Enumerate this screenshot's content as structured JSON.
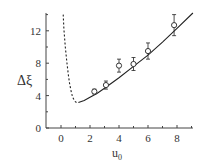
{
  "chart_data": {
    "type": "scatter",
    "title": "",
    "xlabel": "u",
    "xlabel_subscript": "0",
    "ylabel": "Δξ",
    "xlim": [
      -1,
      9.1
    ],
    "ylim": [
      0,
      14.2
    ],
    "xticks": [
      0,
      2,
      4,
      6,
      8
    ],
    "yticks": [
      0,
      4,
      8,
      12
    ],
    "xtick_labels": [
      "0",
      "2",
      "4",
      "6",
      "8"
    ],
    "ytick_labels": [
      "0",
      "4",
      "8",
      "12"
    ],
    "grid": false,
    "legend": null,
    "series": [
      {
        "name": "measured",
        "kind": "points-with-errorbars",
        "marker": "open-circle",
        "x": [
          2.3,
          3.1,
          4.0,
          5.0,
          6.0,
          7.8
        ],
        "y": [
          4.5,
          5.3,
          7.7,
          7.9,
          9.5,
          12.7
        ],
        "yerr": [
          0.3,
          0.5,
          0.8,
          0.8,
          1.0,
          1.3
        ]
      },
      {
        "name": "fit",
        "kind": "line",
        "style": "solid",
        "x": [
          1.2,
          1.6,
          2.0,
          2.5,
          3.0,
          4.0,
          5.0,
          6.0,
          7.0,
          8.0,
          9.1
        ],
        "y": [
          3.15,
          3.4,
          3.8,
          4.3,
          4.9,
          6.2,
          7.6,
          9.0,
          10.6,
          12.3,
          14.2
        ]
      },
      {
        "name": "extrapolation",
        "kind": "line",
        "style": "dashed",
        "x": [
          0.15,
          0.2,
          0.3,
          0.4,
          0.5,
          0.6,
          0.7,
          0.8,
          0.95,
          1.1,
          1.2
        ],
        "y": [
          14.0,
          12.2,
          10.0,
          8.2,
          6.6,
          5.4,
          4.5,
          3.8,
          3.3,
          3.1,
          3.15
        ]
      }
    ]
  },
  "colors": {
    "axis": "#444444",
    "data": "#222222",
    "text": "#333333"
  }
}
